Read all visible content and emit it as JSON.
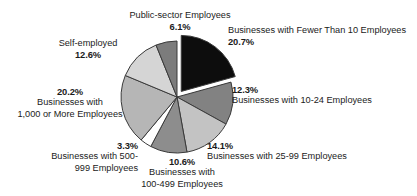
{
  "chart_data": {
    "type": "pie",
    "title": "",
    "subtitle": "",
    "xlabel": "",
    "ylabel": "",
    "legend_position": "none",
    "grid": false,
    "unit": "%",
    "categories": [
      "Businesses with Fewer Than 10 Employees",
      "Businesses with 10-24 Employees",
      "Businesses with 25-99 Employees",
      "Businesses with 100-499 Employees",
      "Businesses with 500-999 Employees",
      "Businesses with 1,000 or More Employees",
      "Self-employed",
      "Public-sector Employees"
    ],
    "values": [
      20.7,
      12.3,
      14.1,
      10.6,
      3.3,
      20.2,
      12.6,
      6.1
    ],
    "slices": [
      {
        "label": "Businesses with Fewer Than 10 Employees",
        "value": 20.7,
        "value_text": "20.7%",
        "color": "#0d0d0d",
        "exploded": true
      },
      {
        "label": "Businesses with 10-24 Employees",
        "value": 12.3,
        "value_text": "12.3%",
        "color": "#828282",
        "exploded": false
      },
      {
        "label": "Businesses with 25-99 Employees",
        "value": 14.1,
        "value_text": "14.1%",
        "color": "#c3c3c3",
        "exploded": false
      },
      {
        "label": "Businesses with 100-499 Employees",
        "value": 10.6,
        "value_text": "10.6%",
        "color": "#8d8d8d",
        "exploded": false
      },
      {
        "label": "Businesses with 500-999 Employees",
        "value": 3.3,
        "value_text": "3.3%",
        "color": "#ffffff",
        "exploded": false
      },
      {
        "label": "Businesses with 1,000 or More Employees",
        "value": 20.2,
        "value_text": "20.2%",
        "color": "#b6b6b6",
        "exploded": false
      },
      {
        "label": "Self-employed",
        "value": 12.6,
        "value_text": "12.6%",
        "color": "#d5d5d5",
        "exploded": false
      },
      {
        "label": "Public-sector Employees",
        "value": 6.1,
        "value_text": "6.1%",
        "color": "#7c7c7c",
        "exploded": false
      }
    ]
  },
  "labels": {
    "public_sector": {
      "name": "Public-sector Employees",
      "pct": "6.1%"
    },
    "self_employed": {
      "name": "Self-employed",
      "pct": "12.6%"
    },
    "thousand_plus": {
      "pct": "20.2%",
      "line1": "Businesses with",
      "line2": "1,000 or More Employees"
    },
    "five_hundred": {
      "pct": "3.3%",
      "line1": "Businesses with 500-",
      "line2": "999 Employees"
    },
    "hundred_499": {
      "pct": "10.6%",
      "line1": "Businesses with",
      "line2": "100-499 Employees"
    },
    "twentyfive_99": {
      "pct": "14.1%",
      "name": "Businesses with 25-99 Employees"
    },
    "ten_24": {
      "pct": "12.3%",
      "name": "Businesses with 10-24 Employees"
    },
    "under_ten": {
      "name": "Businesses with Fewer Than 10 Employees",
      "pct": "20.7%"
    }
  },
  "style": {
    "background": "#ffffff",
    "text_color": "#1b1b1b",
    "slice_outline": "#3a3a3a"
  }
}
